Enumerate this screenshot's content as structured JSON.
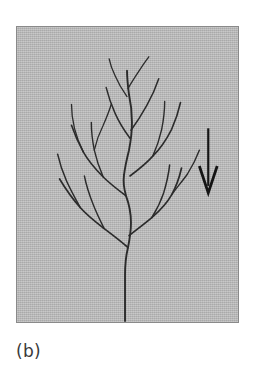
{
  "figure": {
    "caption": "(b)",
    "panel_label": "b",
    "background_color": "#b4b4b4",
    "border_color": "#8a8a8a",
    "ink_color": "#2b2b2b",
    "page_background": "#ffffff",
    "panel": {
      "x": 16,
      "y": 26,
      "width": 223,
      "height": 297
    }
  },
  "direction_arrow": {
    "name": "downward-direction-arrow",
    "orientation": "down",
    "color": "#141414",
    "shaft": {
      "x": 209,
      "y_top": 128,
      "y_bottom": 186
    },
    "head": {
      "left_x": 200,
      "right_x": 218,
      "tip_x": 209,
      "tip_y": 193,
      "wing_y": 166
    },
    "stroke_width": 2.2
  },
  "chart_data": {
    "type": "line",
    "title": "",
    "subtitle": "",
    "xlabel": "",
    "ylabel": "",
    "grid": false,
    "legend": null,
    "annotations": [
      "(b)"
    ],
    "series": [
      {
        "name": "trunk",
        "stroke_width": 1.9,
        "path": "M 109 296 L 109 250 C 109 238 110 230 112 222 C 114 212 115 205 115 197 C 115 186 113 178 110 170 C 108 163 107 156 108 149 C 109 140 111 132 113 124 C 115 114 116 105 116 96 C 116 86 115 77 113 68 C 112 60 111 52 111 44"
      },
      {
        "name": "branch-left-major-lower",
        "stroke_width": 1.7,
        "path": "M 112 222 C 104 215 96 209 88 203 C 79 196 71 190 64 182 C 56 173 49 163 43 153"
      },
      {
        "name": "branch-left-lower-tip-a",
        "stroke_width": 1.5,
        "path": "M 64 182 C 59 173 54 164 50 155 C 46 146 43 137 41 128"
      },
      {
        "name": "branch-left-lower-tip-b",
        "stroke_width": 1.4,
        "path": "M 88 203 C 84 195 80 187 77 179 C 73 169 70 160 68 150"
      },
      {
        "name": "branch-right-major-lower",
        "stroke_width": 1.7,
        "path": "M 113 210 C 121 204 129 198 136 192 C 144 185 151 178 156 169 C 161 160 164 151 166 142"
      },
      {
        "name": "branch-right-lower-tip-a",
        "stroke_width": 1.5,
        "path": "M 136 192 C 141 184 145 176 148 167 C 151 157 153 148 154 139"
      },
      {
        "name": "branch-right-lower-tip-b",
        "stroke_width": 1.4,
        "path": "M 156 169 C 161 162 167 155 172 148 C 177 140 181 132 184 124"
      },
      {
        "name": "branch-left-mid",
        "stroke_width": 1.6,
        "path": "M 110 170 C 102 164 94 158 87 151 C 79 143 72 135 67 126 C 62 117 58 108 55 99"
      },
      {
        "name": "branch-left-mid-tip-a",
        "stroke_width": 1.4,
        "path": "M 87 151 C 83 142 80 133 78 124 C 76 114 75 105 75 96"
      },
      {
        "name": "branch-left-mid-tip-b",
        "stroke_width": 1.3,
        "path": "M 67 126 C 63 118 60 110 58 102 C 56 94 55 86 55 78"
      },
      {
        "name": "branch-left-mid-tip-c",
        "stroke_width": 1.3,
        "path": "M 78 124 C 80 115 83 107 87 99 C 90 92 93 85 95 78"
      },
      {
        "name": "branch-right-mid",
        "stroke_width": 1.6,
        "path": "M 114 150 C 122 144 130 138 137 130 C 145 122 151 113 156 103 C 160 94 163 85 165 76"
      },
      {
        "name": "branch-right-mid-tip",
        "stroke_width": 1.4,
        "path": "M 137 130 C 141 121 144 112 146 103 C 148 93 149 84 149 75"
      },
      {
        "name": "branch-top-left",
        "stroke_width": 1.5,
        "path": "M 114 112 C 108 104 103 96 99 87 C 95 78 92 69 90 61"
      },
      {
        "name": "branch-top-right",
        "stroke_width": 1.5,
        "path": "M 115 104 C 121 96 126 88 131 79 C 136 70 140 61 143 52"
      },
      {
        "name": "branch-top-crown-left",
        "stroke_width": 1.3,
        "path": "M 111 70 C 106 63 102 56 99 49 C 96 43 94 37 93 32"
      },
      {
        "name": "branch-top-crown-right",
        "stroke_width": 1.3,
        "path": "M 112 62 C 116 55 120 49 124 43 C 127 38 130 34 133 30"
      }
    ]
  }
}
